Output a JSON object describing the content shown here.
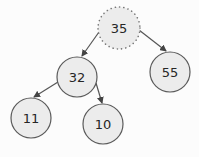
{
  "diagram": {
    "type": "binary-tree",
    "colors": {
      "background": "#fcfcfc",
      "node_fill": "#ececec",
      "node_stroke": "#5a5a5a",
      "edge": "#555555",
      "text": "#262626"
    },
    "nodes": [
      {
        "id": "n35",
        "label": "35",
        "cx": 119,
        "cy": 28,
        "r": 21,
        "style": "dotted",
        "highlighted": true
      },
      {
        "id": "n32",
        "label": "32",
        "cx": 77,
        "cy": 77,
        "r": 20,
        "style": "solid"
      },
      {
        "id": "n55",
        "label": "55",
        "cx": 170,
        "cy": 72,
        "r": 20,
        "style": "solid"
      },
      {
        "id": "n11",
        "label": "11",
        "cx": 31,
        "cy": 118,
        "r": 20,
        "style": "solid"
      },
      {
        "id": "n10",
        "label": "10",
        "cx": 103,
        "cy": 124,
        "r": 20,
        "style": "solid"
      }
    ],
    "edges": [
      {
        "from": "35",
        "to": "32",
        "x1": 99,
        "y1": 32,
        "x2": 82,
        "y2": 56
      },
      {
        "from": "35",
        "to": "55",
        "x1": 139,
        "y1": 30,
        "x2": 166,
        "y2": 51
      },
      {
        "from": "32",
        "to": "11",
        "x1": 58,
        "y1": 82,
        "x2": 34,
        "y2": 97
      },
      {
        "from": "32",
        "to": "10",
        "x1": 96,
        "y1": 83,
        "x2": 102,
        "y2": 103
      }
    ]
  }
}
